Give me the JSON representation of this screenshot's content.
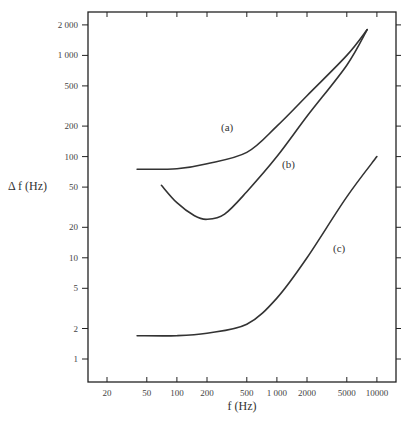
{
  "chart_data": {
    "type": "line",
    "title": "",
    "xlabel": "f (Hz)",
    "ylabel": "Δ f (Hz)",
    "xscale": "log",
    "yscale": "log",
    "xlim": [
      14,
      12500
    ],
    "ylim": [
      0.7,
      2600
    ],
    "x_ticks": [
      20,
      50,
      100,
      200,
      500,
      1000,
      2000,
      5000,
      10000
    ],
    "x_tick_labels": [
      "20",
      "50",
      "100",
      "200",
      "500",
      "1 000",
      "2000",
      "5000",
      "10000"
    ],
    "y_ticks": [
      1,
      2,
      5,
      10,
      20,
      50,
      100,
      200,
      500,
      1000,
      2000
    ],
    "y_tick_labels": [
      "1",
      "2",
      "5",
      "10",
      "20",
      "50",
      "100",
      "200",
      "500",
      "1 000",
      "2 000"
    ],
    "grid": false,
    "legend": "inline labels",
    "series": [
      {
        "name": "(a)",
        "x": [
          40,
          100,
          200,
          500,
          1000,
          2000,
          5000,
          8000
        ],
        "y": [
          75,
          76,
          85,
          110,
          200,
          400,
          1000,
          1800
        ]
      },
      {
        "name": "(b)",
        "x": [
          70,
          100,
          150,
          200,
          300,
          500,
          1000,
          2000,
          5000,
          8000
        ],
        "y": [
          52,
          35,
          26,
          24,
          27,
          45,
          100,
          250,
          800,
          1800
        ]
      },
      {
        "name": "(c)",
        "x": [
          40,
          100,
          200,
          500,
          1000,
          2000,
          5000,
          10000
        ],
        "y": [
          1.7,
          1.7,
          1.8,
          2.2,
          4,
          10,
          40,
          100
        ]
      }
    ]
  },
  "labels": {
    "xlabel": "f (Hz)",
    "ylabel": "Δ f (Hz)",
    "curve_a": "(a)",
    "curve_b": "(b)",
    "curve_c": "(c)"
  }
}
